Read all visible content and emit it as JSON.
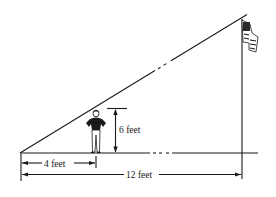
{
  "diagram": {
    "type": "similar-triangles-shadow",
    "labels": {
      "person_height": "6 feet",
      "shadow_to_person": "4 feet",
      "shadow_to_pole": "12 feet"
    },
    "elements": [
      "ground-line",
      "sight-line",
      "person",
      "flagpole",
      "flag"
    ],
    "colors": {
      "ink": "#1a1a1a",
      "background": "#ffffff"
    }
  }
}
